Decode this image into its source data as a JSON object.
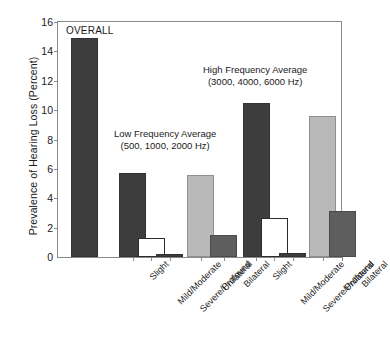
{
  "chart_data": {
    "type": "bar",
    "title": "",
    "xlabel": "",
    "ylabel": "Prevalence of Hearing Loss (Percent)",
    "ylim": [
      0,
      16
    ],
    "ytick_labels": [
      "0",
      "2",
      "4",
      "6",
      "8",
      "10",
      "12",
      "14",
      "16"
    ],
    "ytick_values": [
      0,
      2,
      4,
      6,
      8,
      10,
      12,
      14,
      16
    ],
    "grid": false,
    "legend_position": "none",
    "categories": [
      "OVERALL",
      "Slight",
      "Mild/Moderate",
      "Severe/Profound",
      "Unilateral",
      "Bilateral",
      "Slight",
      "Mild/Moderate",
      "Severe/Profound",
      "Unilateral",
      "Bilateral"
    ],
    "values": [
      14.9,
      5.7,
      1.3,
      0.2,
      5.6,
      1.5,
      10.5,
      2.65,
      0.3,
      9.6,
      3.1
    ],
    "bar_styles": [
      "dark",
      "dark",
      "white",
      "dark",
      "light",
      "mid",
      "dark",
      "white",
      "dark",
      "light",
      "mid"
    ],
    "groups": [
      {
        "name": "OVERALL",
        "annotation": "OVERALL",
        "annotation_lines": [
          "OVERALL"
        ],
        "bar_indices": [
          0
        ]
      },
      {
        "name": "Low Frequency Average",
        "annotation_lines": [
          "Low Frequency Average",
          "(500, 1000, 2000 Hz)"
        ],
        "bar_indices": [
          1,
          2,
          3,
          4,
          5
        ]
      },
      {
        "name": "High Frequency Average",
        "annotation_lines": [
          "High Frequency Average",
          "(3000, 4000, 6000 Hz)"
        ],
        "bar_indices": [
          6,
          7,
          8,
          9,
          10
        ]
      }
    ],
    "colors": {
      "dark": "#3d3d3d",
      "white": "#ffffff",
      "light": "#b9b9b9",
      "mid": "#5e5e5e",
      "axis": "#8a8a8a",
      "text": "#1a1a1a"
    }
  }
}
